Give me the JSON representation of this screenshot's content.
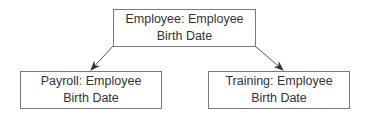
{
  "diagram": {
    "nodes": [
      {
        "id": "employee",
        "line1": "Employee: Employee",
        "line2": "Birth Date"
      },
      {
        "id": "payroll",
        "line1": "Payroll: Employee",
        "line2": "Birth Date"
      },
      {
        "id": "training",
        "line1": "Training: Employee",
        "line2": "Birth Date"
      }
    ],
    "edges": [
      {
        "from": "employee",
        "to": "payroll"
      },
      {
        "from": "employee",
        "to": "training"
      }
    ],
    "colors": {
      "border": "#7a7a7a",
      "line": "#555555",
      "text": "#333333"
    }
  }
}
